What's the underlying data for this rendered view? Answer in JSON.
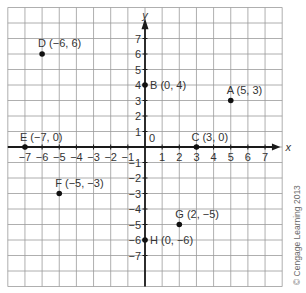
{
  "chart_data": {
    "type": "scatter",
    "title": "",
    "xlabel": "x",
    "ylabel": "y",
    "xlim": [
      -8,
      8
    ],
    "ylim": [
      -9,
      9
    ],
    "grid": true,
    "x_ticks": [
      -7,
      -6,
      -5,
      -4,
      -3,
      -2,
      -1,
      1,
      2,
      3,
      4,
      5,
      6,
      7
    ],
    "y_ticks": [
      7,
      6,
      5,
      4,
      3,
      2,
      1,
      -1,
      -2,
      -3,
      -4,
      -5,
      -6,
      -7
    ],
    "x_tick_labels": [
      "−7",
      "−6",
      "−5",
      "−4",
      "−3",
      "−2",
      "−1",
      "1",
      "2",
      "3",
      "4",
      "5",
      "6",
      "7"
    ],
    "y_tick_labels": [
      "7",
      "6",
      "5",
      "4",
      "3",
      "2",
      "1",
      "−1",
      "−2",
      "−3",
      "−4",
      "−5",
      "−6",
      "−7"
    ],
    "origin_label": "0",
    "points": [
      {
        "name": "A",
        "x": 5,
        "y": 3,
        "label": "A (5, 3)"
      },
      {
        "name": "B",
        "x": 0,
        "y": 4,
        "label": "B (0, 4)"
      },
      {
        "name": "C",
        "x": 3,
        "y": 0,
        "label": "C (3, 0)"
      },
      {
        "name": "D",
        "x": -6,
        "y": 6,
        "label": "D (−6, 6)"
      },
      {
        "name": "E",
        "x": -7,
        "y": 0,
        "label": "E (−7, 0)"
      },
      {
        "name": "F",
        "x": -5,
        "y": -3,
        "label": "F (−5, −3)"
      },
      {
        "name": "G",
        "x": 2,
        "y": -5,
        "label": "G (2, −5)"
      },
      {
        "name": "H",
        "x": 0,
        "y": -6,
        "label": "H (0, −6)"
      }
    ]
  },
  "copyright": "© Cengage Learning 2013",
  "colors": {
    "grid": "#9a9a9a",
    "axis": "#1a1a1a",
    "text": "#333333",
    "point": "#111111"
  }
}
